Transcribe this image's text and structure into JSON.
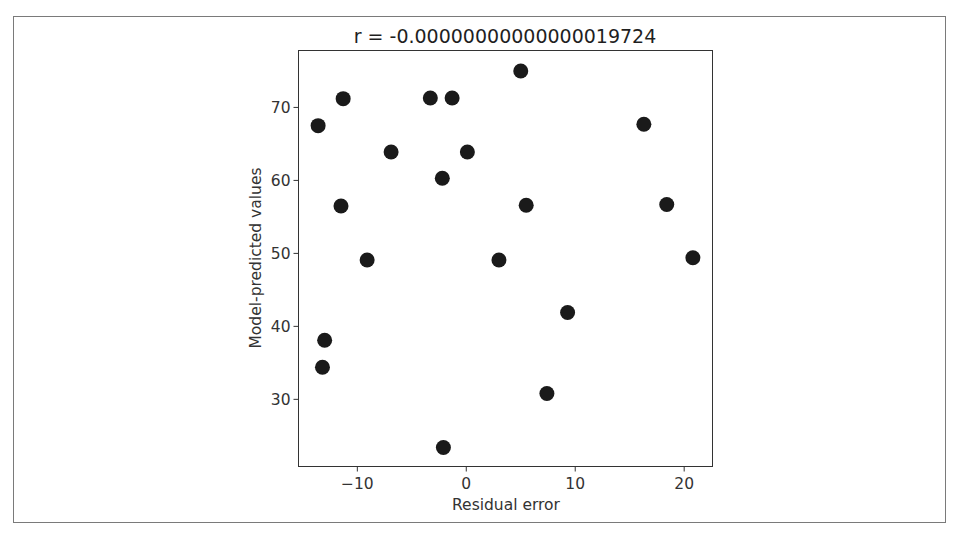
{
  "chart_data": {
    "type": "scatter",
    "title": "r = -0.00000000000000019724",
    "xlabel": "Residual error",
    "ylabel": "Model-predicted values",
    "xlim": [
      -15.4,
      22.6
    ],
    "ylim": [
      20.8,
      77.8
    ],
    "xticks": [
      -10,
      0,
      10,
      20
    ],
    "xtick_labels": [
      "−10",
      "0",
      "10",
      "20"
    ],
    "yticks": [
      30,
      40,
      50,
      60,
      70
    ],
    "ytick_labels": [
      "30",
      "40",
      "50",
      "60",
      "70"
    ],
    "grid": false,
    "legend": null,
    "marker_color": "#1a1a1a",
    "points": [
      {
        "x": -11.3,
        "y": 71.2
      },
      {
        "x": -13.6,
        "y": 67.5
      },
      {
        "x": -3.3,
        "y": 71.3
      },
      {
        "x": -1.3,
        "y": 71.3
      },
      {
        "x": -6.9,
        "y": 63.9
      },
      {
        "x": 0.1,
        "y": 63.9
      },
      {
        "x": -2.2,
        "y": 60.3
      },
      {
        "x": -11.5,
        "y": 56.5
      },
      {
        "x": -9.1,
        "y": 49.1
      },
      {
        "x": -13.0,
        "y": 38.1
      },
      {
        "x": -13.2,
        "y": 34.4
      },
      {
        "x": 5.0,
        "y": 75.0
      },
      {
        "x": 5.5,
        "y": 56.6
      },
      {
        "x": 3.0,
        "y": 49.1
      },
      {
        "x": 9.3,
        "y": 41.9
      },
      {
        "x": 7.4,
        "y": 30.8
      },
      {
        "x": -2.1,
        "y": 23.4
      },
      {
        "x": 16.3,
        "y": 67.7
      },
      {
        "x": 18.4,
        "y": 56.7
      },
      {
        "x": 20.8,
        "y": 49.4
      }
    ]
  }
}
